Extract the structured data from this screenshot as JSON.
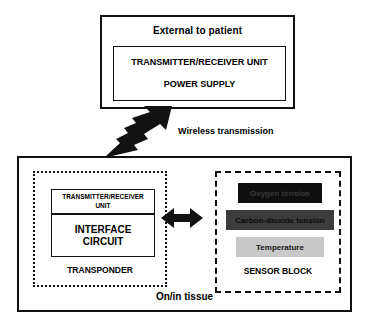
{
  "diagram": {
    "external": {
      "title": "External to patient",
      "unit_line_1": "TRANSMITTER/RECEIVER UNIT",
      "unit_line_2": "POWER SUPPLY"
    },
    "wireless": {
      "label": "Wireless transmission",
      "arrow_icon": "lightning-bolt-arrow-icon",
      "direction": "up-right"
    },
    "tissue": {
      "label": "On/in tissue"
    },
    "transponder": {
      "label": "TRANSPONDER",
      "tr_unit": "TRANSMITTER/RECEIVER\nUNIT",
      "interface_circuit": "INTERFACE\nCIRCUIT"
    },
    "link": {
      "arrow_icon": "double-headed-arrow-icon",
      "direction": "bidirectional"
    },
    "sensor_block": {
      "label": "SENSOR BLOCK",
      "sensors": [
        {
          "name": "Oxygen tension",
          "fill": "#100f0f",
          "text_color": "#3a3a3a"
        },
        {
          "name": "Carbon-dioxide tension",
          "fill": "#3c3c3c",
          "text_color": "#0a0a0a"
        },
        {
          "name": "Temperature",
          "fill": "#c9c9c9",
          "text_color": "#141414"
        }
      ]
    },
    "colors": {
      "stroke": "#111111",
      "background": "#ffffff"
    }
  }
}
